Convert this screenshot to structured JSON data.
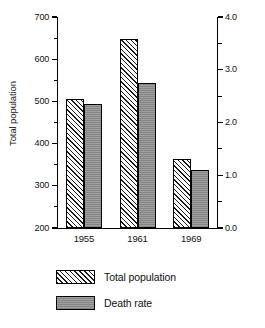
{
  "chart_data": {
    "type": "bar",
    "title": "",
    "subtitle": "",
    "categories": [
      "1955",
      "1961",
      "1969"
    ],
    "xlabel": "",
    "grid": false,
    "legend_position": "bottom-left",
    "series": [
      {
        "name": "Total population",
        "axis": "left",
        "pattern": "diagonal-hatch",
        "color": "#ffffff",
        "values": [
          505,
          648,
          363
        ]
      },
      {
        "name": "Death rate",
        "axis": "right",
        "pattern": "solid-gray",
        "color": "#949494",
        "values": [
          2.35,
          2.75,
          1.1
        ]
      }
    ],
    "left_axis": {
      "label": "Total population",
      "ylim": [
        200,
        700
      ],
      "ticks": [
        200,
        300,
        400,
        500,
        600,
        700
      ],
      "ticklabels": [
        "200",
        "300",
        "400",
        "500",
        "600",
        "700"
      ],
      "minor_ticks": [
        250,
        350,
        450,
        550,
        650
      ]
    },
    "right_axis": {
      "label": "Deaths per 100 men",
      "ylim": [
        0.0,
        4.0
      ],
      "ticks": [
        0.0,
        1.0,
        2.0,
        3.0,
        4.0
      ],
      "ticklabels": [
        "0.0",
        "1.0",
        "2.0",
        "3.0",
        "4.0"
      ],
      "minor_ticks": [
        0.5,
        1.5,
        2.5,
        3.5
      ]
    }
  },
  "legend": {
    "items": [
      {
        "label": "Total population",
        "swatch": "diagonal-hatch-swatch"
      },
      {
        "label": "Death rate",
        "swatch": "solid-gray-swatch"
      }
    ]
  }
}
